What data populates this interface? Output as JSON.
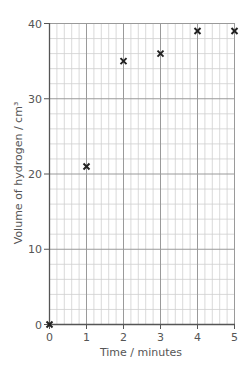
{
  "chart_data": {
    "type": "scatter",
    "title": "",
    "xlabel": "Time / minutes",
    "ylabel": "Volume of hydrogen / cm³",
    "x": [
      0,
      1,
      2,
      3,
      4,
      5
    ],
    "values": [
      0,
      21,
      35,
      36,
      39,
      39
    ],
    "series": [
      {
        "name": "Volume of hydrogen",
        "marker": "x",
        "x": [
          0,
          1,
          2,
          3,
          4,
          5
        ],
        "values": [
          0,
          21,
          35,
          36,
          39,
          39
        ]
      }
    ],
    "xlim": [
      0,
      5
    ],
    "ylim": [
      0,
      40
    ],
    "x_ticks": [
      "0",
      "1",
      "2",
      "3",
      "4",
      "5"
    ],
    "y_ticks": [
      "0",
      "10",
      "20",
      "30",
      "40"
    ],
    "grid": true,
    "minor_divisions_per_major": 5,
    "legend": "none"
  },
  "style": {
    "grid_minor_color": "#cfcfcf",
    "grid_major_color": "#9a9a9a",
    "axis_color": "#555555",
    "marker_color": "#222222"
  }
}
